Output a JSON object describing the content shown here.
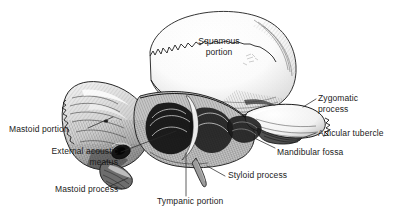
{
  "figure": {
    "background_color": "#ffffff",
    "ink_color": "#1b1b1b",
    "leader_line_color": "#2a2a2a"
  },
  "labels": {
    "squamous_portion": {
      "line1": "Squamous",
      "line2": "portion",
      "align": "center"
    },
    "zygomatic_process": {
      "line1": "Zygomatic",
      "line2": "process",
      "align": "left"
    },
    "articular_tubercle": {
      "text": "Articular tubercle",
      "align": "left"
    },
    "mandibular_fossa": {
      "text": "Mandibular fossa",
      "align": "left"
    },
    "mastoid_portion": {
      "text": "Mastoid portion",
      "align": "left"
    },
    "external_acoustic_meatus": {
      "line1": "External acoustic",
      "line2": "meatus",
      "align": "right"
    },
    "mastoid_process": {
      "text": "Mastoid process",
      "align": "left"
    },
    "tympanic_portion": {
      "text": "Tympanic portion",
      "align": "left"
    },
    "styloid_process": {
      "text": "Styloid process",
      "align": "left"
    }
  }
}
